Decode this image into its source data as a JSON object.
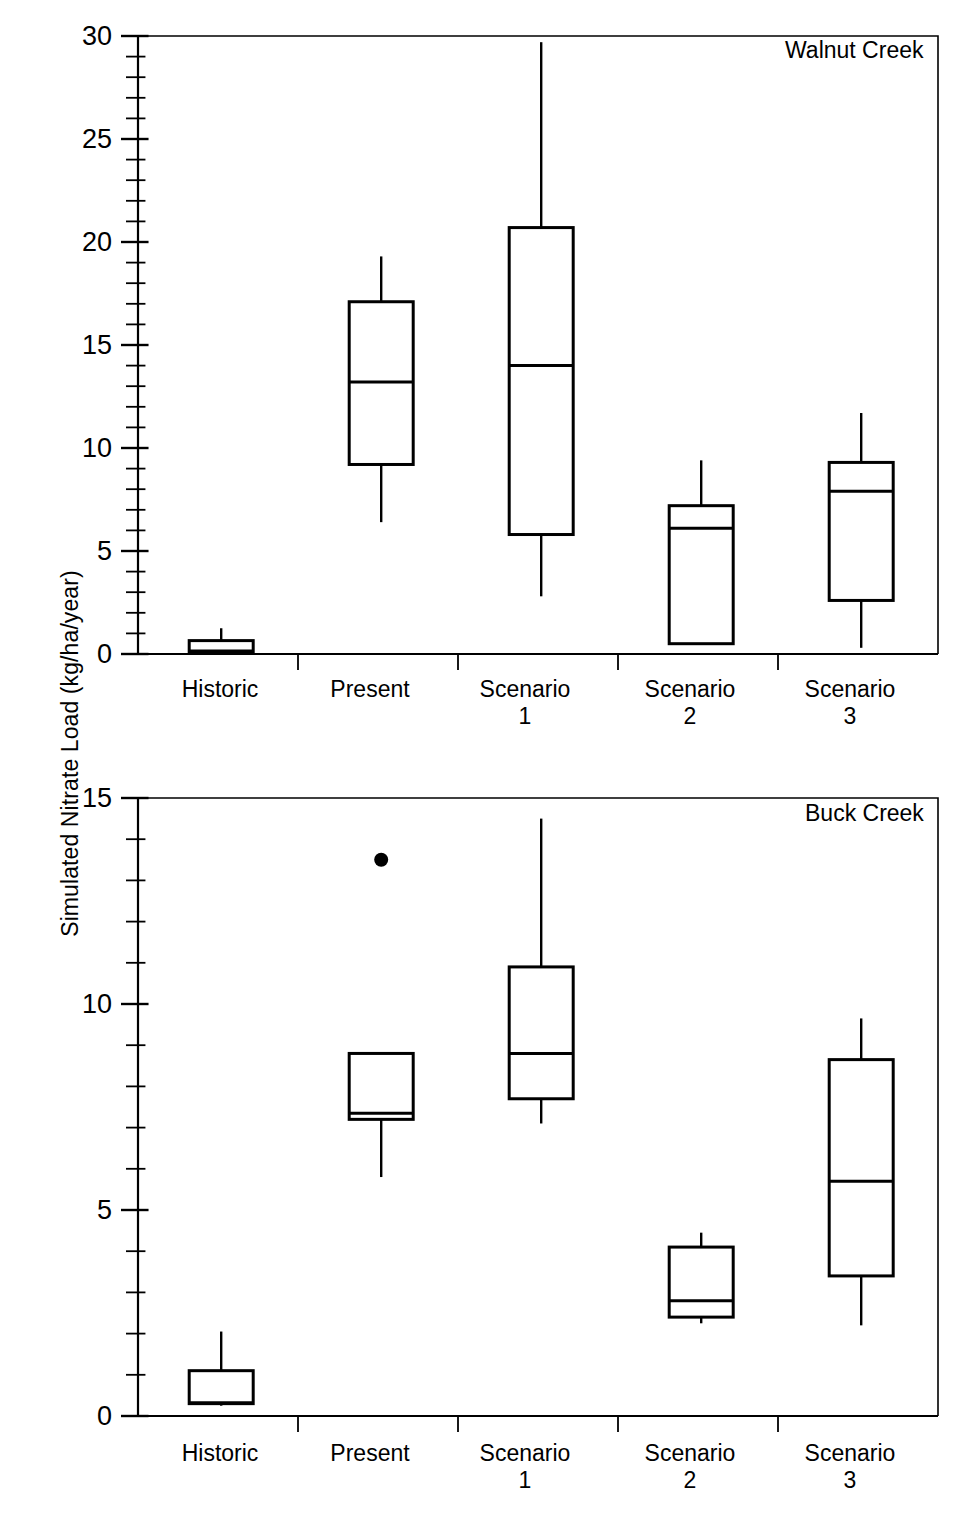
{
  "figure": {
    "ylabel": "Simulated Nitrate Load (kg/ha/year)",
    "panels": [
      {
        "name": "Walnut Creek"
      },
      {
        "name": "Buck Creek"
      }
    ]
  },
  "chart_data": [
    {
      "type": "box",
      "title": "Walnut Creek",
      "panel_label": "Walnut Creek",
      "xlabel": "",
      "ylabel": "Simulated Nitrate Load (kg/ha/year)",
      "ylim": [
        0,
        30
      ],
      "yticks": [
        0,
        5,
        10,
        15,
        20,
        25,
        30
      ],
      "yticklabels": [
        "0",
        "5",
        "10",
        "15",
        "20",
        "25",
        "30"
      ],
      "minor_tick_step": 1,
      "grid": false,
      "legend": "none",
      "categories": [
        "Historic",
        "Present",
        "Scenario 1",
        "Scenario 2",
        "Scenario 3"
      ],
      "boxes": [
        {
          "category": "Historic",
          "whisker_low": 0.0,
          "q1": 0.1,
          "median": 0.15,
          "q3": 0.65,
          "whisker_high": 1.25,
          "outliers": []
        },
        {
          "category": "Present",
          "whisker_low": 6.4,
          "q1": 9.2,
          "median": 13.2,
          "q3": 17.1,
          "whisker_high": 19.3,
          "outliers": []
        },
        {
          "category": "Scenario 1",
          "whisker_low": 2.8,
          "q1": 5.8,
          "median": 14.0,
          "q3": 20.7,
          "whisker_high": 29.7,
          "outliers": []
        },
        {
          "category": "Scenario 2",
          "whisker_low": 0.45,
          "q1": 0.5,
          "median": 6.1,
          "q3": 7.2,
          "whisker_high": 9.4,
          "outliers": []
        },
        {
          "category": "Scenario 3",
          "whisker_low": 0.3,
          "q1": 2.6,
          "median": 7.9,
          "q3": 9.3,
          "whisker_high": 11.7,
          "outliers": []
        }
      ]
    },
    {
      "type": "box",
      "title": "Buck Creek",
      "panel_label": "Buck Creek",
      "xlabel": "",
      "ylabel": "Simulated Nitrate Load (kg/ha/year)",
      "ylim": [
        0,
        15
      ],
      "yticks": [
        0,
        5,
        10,
        15
      ],
      "yticklabels": [
        "0",
        "5",
        "10",
        "15"
      ],
      "minor_tick_step": 1,
      "grid": false,
      "legend": "none",
      "categories": [
        "Historic",
        "Present",
        "Scenario 1",
        "Scenario 2",
        "Scenario 3"
      ],
      "boxes": [
        {
          "category": "Historic",
          "whisker_low": 0.25,
          "q1": 0.3,
          "median": 0.32,
          "q3": 1.1,
          "whisker_high": 2.05,
          "outliers": []
        },
        {
          "category": "Present",
          "whisker_low": 5.8,
          "q1": 7.2,
          "median": 7.35,
          "q3": 8.8,
          "whisker_high": 8.8,
          "outliers": [
            13.5
          ]
        },
        {
          "category": "Scenario 1",
          "whisker_low": 7.1,
          "q1": 7.7,
          "median": 8.8,
          "q3": 10.9,
          "whisker_high": 14.5,
          "outliers": []
        },
        {
          "category": "Scenario 2",
          "whisker_low": 2.25,
          "q1": 2.4,
          "median": 2.8,
          "q3": 4.1,
          "whisker_high": 4.45,
          "outliers": []
        },
        {
          "category": "Scenario 3",
          "whisker_low": 2.2,
          "q1": 3.4,
          "median": 5.7,
          "q3": 8.65,
          "whisker_high": 9.65,
          "outliers": []
        }
      ]
    }
  ],
  "axis_labels": {
    "historic": "Historic",
    "present": "Present",
    "scenario1": "Scenario\n1",
    "scenario2": "Scenario\n2",
    "scenario3": "Scenario\n3"
  },
  "colors": {
    "ink": "#000000",
    "background": "#ffffff"
  }
}
